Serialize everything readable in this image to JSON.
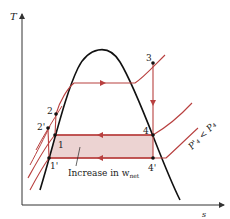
{
  "diagram": {
    "type": "T-s diagram (Rankine cycle, lowered condenser pressure)",
    "axes": {
      "y_label": "T",
      "x_label": "s"
    },
    "points": [
      {
        "id": "1",
        "label": "1"
      },
      {
        "id": "1p",
        "label": "1'"
      },
      {
        "id": "2",
        "label": "2"
      },
      {
        "id": "2p",
        "label": "2'"
      },
      {
        "id": "3",
        "label": "3"
      },
      {
        "id": "4",
        "label": "4"
      },
      {
        "id": "4p",
        "label": "4'"
      }
    ],
    "annotation": {
      "text_main": "Increase in w",
      "text_sub": "net"
    },
    "pressure_label": {
      "text": "P'₄ < P₄"
    },
    "colors": {
      "dome": "#111111",
      "cycle": "#b8403f",
      "shaded_area": "#ecd3d2",
      "axis": "#333333"
    }
  }
}
